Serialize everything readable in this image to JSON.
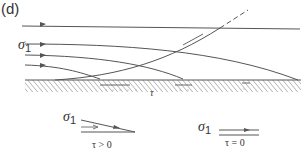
{
  "panel_label": "(d)",
  "stress_label": {
    "symbol": "σ",
    "subscript": "1"
  },
  "shear_label": "τ",
  "legend": [
    {
      "sigma": "σ",
      "sub": "1",
      "condition": "τ > 0"
    },
    {
      "sigma": "σ",
      "sub": "1",
      "condition": "τ = 0"
    }
  ],
  "colors": {
    "line": "#555555",
    "hatch": "#666666",
    "text": "#333333"
  }
}
